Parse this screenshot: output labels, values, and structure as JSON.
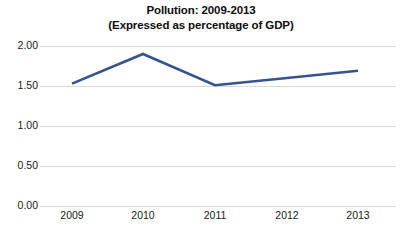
{
  "chart_data": {
    "type": "line",
    "title": "Pollution: 2009-2013",
    "subtitle": "(Expressed as percentage of GDP)",
    "title_line1": "Pollution: 2009-2013",
    "title_line2": "(Expressed as percentage of GDP)",
    "xlabel": "",
    "ylabel": "",
    "categories": [
      "2009",
      "2010",
      "2011",
      "2012",
      "2013"
    ],
    "values": [
      1.53,
      1.9,
      1.51,
      1.6,
      1.69
    ],
    "series": [
      {
        "name": "Pollution",
        "values": [
          1.53,
          1.9,
          1.51,
          1.6,
          1.69
        ]
      }
    ],
    "ylim": [
      0.0,
      2.0
    ],
    "ytick_labels": [
      "2.00",
      "1.50",
      "1.00",
      "0.50",
      "0.00"
    ],
    "ytick_values": [
      2.0,
      1.5,
      1.0,
      0.5,
      0.0
    ],
    "grid": true,
    "grid_color": "#d9d9d9",
    "legend": false,
    "legend_position": "none",
    "line_color": "#36538f",
    "line_width": 2.6,
    "markers": false,
    "background": "#ffffff",
    "text_color": "#1a1a1a",
    "title_color": "#0d0d0d"
  }
}
